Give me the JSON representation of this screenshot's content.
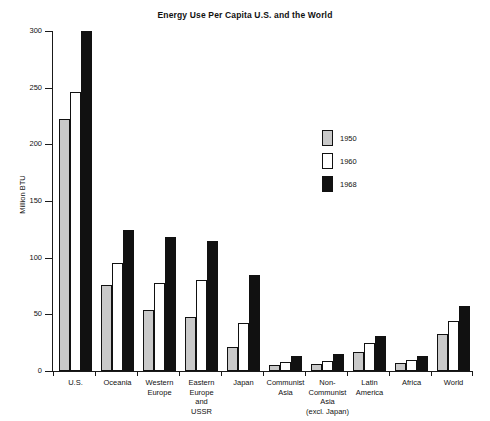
{
  "chart_data": {
    "type": "bar",
    "title": "Energy Use Per Capita U.S. and the World",
    "xlabel": "",
    "ylabel": "Million BTU",
    "ylim": [
      0,
      300
    ],
    "yticks": [
      0,
      50,
      100,
      150,
      200,
      250,
      300
    ],
    "grid": false,
    "legend_position": "center-right",
    "categories": [
      "U.S.",
      "Oceania",
      "Western\nEurope",
      "Eastern\nEurope\nand\nUSSR",
      "Japan",
      "Communist\nAsia",
      "Non-\nCommunist\nAsia\n(excl. Japan)",
      "Latin\nAmerica",
      "Africa",
      "World"
    ],
    "series": [
      {
        "name": "1950",
        "color": "#c9c9c9",
        "values": [
          222,
          76,
          54,
          48,
          21,
          5,
          6,
          17,
          7,
          33
        ]
      },
      {
        "name": "1960",
        "color": "#ffffff",
        "values": [
          246,
          95,
          78,
          80,
          42,
          8,
          9,
          25,
          10,
          44
        ]
      },
      {
        "name": "1968",
        "color": "#111111",
        "values": [
          300,
          124,
          118,
          115,
          85,
          13,
          15,
          31,
          13,
          57
        ]
      }
    ]
  },
  "axis": {
    "y_title": "Million BTU",
    "y_tick_labels": [
      "300",
      "250",
      "200",
      "150",
      "100",
      "50",
      "0"
    ]
  },
  "legend": {
    "items": [
      {
        "label": "1950",
        "color": "#c9c9c9"
      },
      {
        "label": "1960",
        "color": "#ffffff"
      },
      {
        "label": "1968",
        "color": "#111111"
      }
    ]
  },
  "categories_display": [
    {
      "lines": [
        "U.S."
      ]
    },
    {
      "lines": [
        "Oceania"
      ]
    },
    {
      "lines": [
        "Western",
        "Europe"
      ]
    },
    {
      "lines": [
        "Eastern",
        "Europe",
        "and",
        "USSR"
      ]
    },
    {
      "lines": [
        "Japan"
      ]
    },
    {
      "lines": [
        "Communist",
        "Asia"
      ]
    },
    {
      "lines": [
        "Non-",
        "Communist",
        "Asia",
        "(excl. Japan)"
      ]
    },
    {
      "lines": [
        "Latin",
        "America"
      ]
    },
    {
      "lines": [
        "Africa"
      ]
    },
    {
      "lines": [
        "World"
      ]
    }
  ]
}
